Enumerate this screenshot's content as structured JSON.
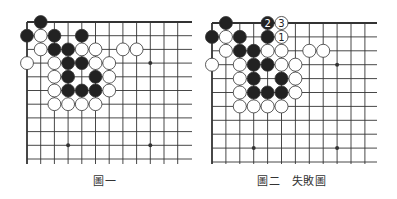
{
  "diagrams": [
    {
      "caption": "圖一",
      "origin": [
        27,
        22
      ],
      "spacing": 13.7,
      "cols": 12,
      "rows": 11,
      "right_edge": 192,
      "bottom_edge": 164,
      "hoshi": [
        [
          3,
          3
        ],
        [
          9,
          3
        ],
        [
          3,
          9
        ],
        [
          9,
          9
        ]
      ],
      "black": [
        [
          1,
          0
        ],
        [
          0,
          1
        ],
        [
          2,
          1
        ],
        [
          4,
          1
        ],
        [
          2,
          2
        ],
        [
          3,
          2
        ],
        [
          3,
          3
        ],
        [
          4,
          3
        ],
        [
          3,
          4
        ],
        [
          5,
          4
        ],
        [
          3,
          5
        ],
        [
          4,
          5
        ],
        [
          5,
          5
        ]
      ],
      "white": [
        [
          1,
          1
        ],
        [
          1,
          2
        ],
        [
          4,
          2
        ],
        [
          5,
          2
        ],
        [
          7,
          2
        ],
        [
          8,
          2
        ],
        [
          0,
          3
        ],
        [
          2,
          3
        ],
        [
          5,
          3
        ],
        [
          6,
          3
        ],
        [
          2,
          4
        ],
        [
          6,
          4
        ],
        [
          2,
          5
        ],
        [
          6,
          5
        ],
        [
          2,
          6
        ],
        [
          3,
          6
        ],
        [
          4,
          6
        ],
        [
          5,
          6
        ]
      ],
      "numbered": []
    },
    {
      "caption": "圖二　失敗圖",
      "origin": [
        212,
        23
      ],
      "spacing": 13.9,
      "cols": 12,
      "rows": 11,
      "right_edge": 377,
      "bottom_edge": 164,
      "hoshi": [
        [
          3,
          3
        ],
        [
          9,
          3
        ],
        [
          3,
          9
        ],
        [
          9,
          9
        ]
      ],
      "black": [
        [
          1,
          0
        ],
        [
          0,
          1
        ],
        [
          2,
          1
        ],
        [
          4,
          1
        ],
        [
          2,
          2
        ],
        [
          3,
          2
        ],
        [
          3,
          3
        ],
        [
          4,
          3
        ],
        [
          3,
          4
        ],
        [
          5,
          4
        ],
        [
          3,
          5
        ],
        [
          4,
          5
        ],
        [
          5,
          5
        ]
      ],
      "white": [
        [
          1,
          1
        ],
        [
          4,
          2
        ],
        [
          5,
          2
        ],
        [
          1,
          2
        ],
        [
          7,
          2
        ],
        [
          8,
          2
        ],
        [
          0,
          3
        ],
        [
          2,
          3
        ],
        [
          5,
          3
        ],
        [
          6,
          3
        ],
        [
          2,
          4
        ],
        [
          6,
          4
        ],
        [
          2,
          5
        ],
        [
          6,
          5
        ],
        [
          2,
          6
        ],
        [
          3,
          6
        ],
        [
          4,
          6
        ],
        [
          5,
          6
        ]
      ],
      "numbered": [
        {
          "col": 5,
          "row": 1,
          "color": "white",
          "label": "1"
        },
        {
          "col": 4,
          "row": 0,
          "color": "black",
          "label": "2"
        },
        {
          "col": 5,
          "row": 0,
          "color": "white",
          "label": "3"
        }
      ]
    }
  ],
  "colors": {
    "line": "#333333",
    "black_stone": "#222222",
    "white_stone": "#ffffff",
    "stone_outline": "#333333"
  }
}
